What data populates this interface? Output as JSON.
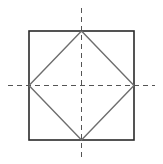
{
  "diagram": {
    "title": "",
    "colors": {
      "background": "#ffffff",
      "square_stroke": "#2a2a2a",
      "diamond_stroke": "#6e6e6e",
      "axis_stroke": "#555555"
    },
    "square": {
      "x": 29,
      "y": 31,
      "width": 105,
      "height": 109
    },
    "diamond": {
      "points": [
        [
          81.5,
          31
        ],
        [
          134,
          85.5
        ],
        [
          81.5,
          140
        ],
        [
          29,
          85.5
        ]
      ]
    },
    "axes": {
      "vertical": {
        "x": 81.5,
        "y1": 8,
        "y2": 158,
        "dash": "5,4"
      },
      "horizontal": {
        "y": 85.5,
        "x1": 8,
        "x2": 155,
        "dash": "5,4"
      }
    }
  }
}
